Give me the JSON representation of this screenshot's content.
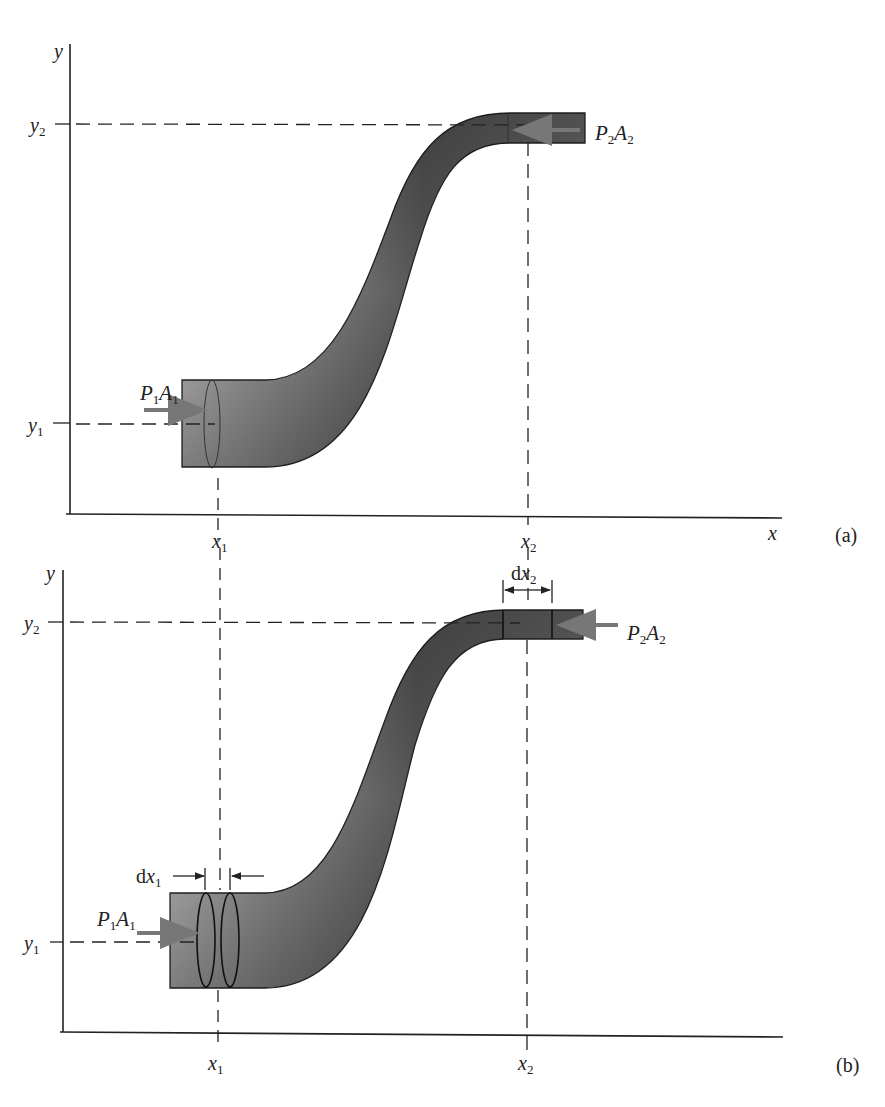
{
  "panels": [
    {
      "id": "a",
      "caption": "(a)",
      "axes": {
        "x_label": "x",
        "y_label": "y"
      },
      "ticks": {
        "x1": {
          "base": "x",
          "sub": "1"
        },
        "x2": {
          "base": "x",
          "sub": "2"
        },
        "y1": {
          "base": "y",
          "sub": "1"
        },
        "y2": {
          "base": "y",
          "sub": "2"
        }
      },
      "forces": {
        "inlet": {
          "p": "P",
          "p_sub": "1",
          "a": "A",
          "a_sub": "1"
        },
        "outlet": {
          "p": "P",
          "p_sub": "2",
          "a": "A",
          "a_sub": "2"
        }
      }
    },
    {
      "id": "b",
      "caption": "(b)",
      "axes": {
        "x_label": "",
        "y_label": "y"
      },
      "ticks": {
        "x1": {
          "base": "x",
          "sub": "1"
        },
        "x2": {
          "base": "x",
          "sub": "2"
        },
        "y1": {
          "base": "y",
          "sub": "1"
        },
        "y2": {
          "base": "y",
          "sub": "2"
        }
      },
      "forces": {
        "inlet": {
          "p": "P",
          "p_sub": "1",
          "a": "A",
          "a_sub": "1"
        },
        "outlet": {
          "p": "P",
          "p_sub": "2",
          "a": "A",
          "a_sub": "2"
        }
      },
      "displacements": {
        "dx1": {
          "d": "d",
          "base": "x",
          "sub": "1"
        },
        "dx2": {
          "d": "d",
          "base": "x",
          "sub": "2"
        }
      }
    }
  ],
  "colors": {
    "pipe_dark": "#3a3a3a",
    "pipe_light": "#9a9a9a",
    "arrow": "#777777",
    "line": "#222222"
  }
}
